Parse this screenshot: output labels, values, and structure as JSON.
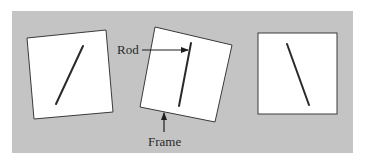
{
  "figure": {
    "background_color": "#ffffff",
    "panel_color": "#c4c4c4",
    "frame_fill": "#ffffff",
    "frame_stroke": "#3a3a3a",
    "rod_color": "#2a2a2a",
    "arrow_color": "#1e1e1e"
  },
  "panels": [
    {
      "id": "left",
      "description": "Frame tilted counterclockwise, rod tilted right",
      "frame_corners": [
        [
          27,
          38
        ],
        [
          106,
          30
        ],
        [
          113,
          112
        ],
        [
          34,
          119
        ]
      ],
      "rod": [
        [
          83,
          46
        ],
        [
          56,
          104
        ]
      ]
    },
    {
      "id": "middle",
      "description": "Frame tilted clockwise, rod nearly vertical",
      "frame_corners": [
        [
          155,
          27
        ],
        [
          232,
          45
        ],
        [
          215,
          122
        ],
        [
          140,
          107
        ]
      ],
      "rod": [
        [
          191,
          43
        ],
        [
          179,
          106
        ]
      ]
    },
    {
      "id": "right",
      "description": "Upright frame, rod tilted left",
      "frame_corners": [
        [
          258,
          33
        ],
        [
          337,
          33
        ],
        [
          337,
          114
        ],
        [
          258,
          114
        ]
      ],
      "rod": [
        [
          287,
          44
        ],
        [
          309,
          105
        ]
      ]
    }
  ],
  "annotations": {
    "rod_label": "Rod",
    "frame_label": "Frame"
  }
}
